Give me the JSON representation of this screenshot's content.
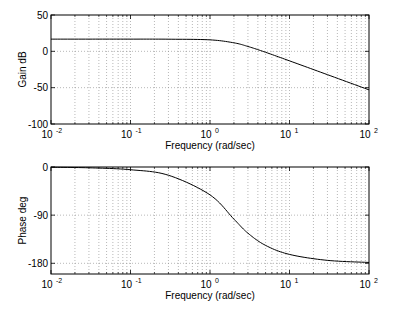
{
  "figure": {
    "width": 399,
    "height": 314,
    "background": "#ffffff",
    "line_color": "#000000",
    "grid_color": "#888888"
  },
  "chart_data": [
    {
      "type": "line",
      "title": "",
      "xlabel": "Frequency (rad/sec)",
      "ylabel": "Gain dB",
      "xscale": "log",
      "xlim": [
        0.01,
        100
      ],
      "ylim": [
        -100,
        50
      ],
      "xticks": [
        0.01,
        0.1,
        1,
        10,
        100
      ],
      "xtick_labels": [
        {
          "base": "10",
          "exp": "-2"
        },
        {
          "base": "10",
          "exp": "-1"
        },
        {
          "base": "10",
          "exp": "0"
        },
        {
          "base": "10",
          "exp": "1"
        },
        {
          "base": "10",
          "exp": "2"
        }
      ],
      "yticks": [
        50,
        0,
        -50,
        -100
      ],
      "ytick_labels": [
        "50",
        "0",
        "-50",
        "-100"
      ],
      "grid": true,
      "legend": null,
      "series": [
        {
          "name": "gain",
          "x": [
            0.01,
            0.03,
            0.1,
            0.3,
            1,
            2,
            3,
            5,
            10,
            30,
            100
          ],
          "y": [
            16.8,
            16.8,
            16.8,
            16.7,
            15.8,
            11.7,
            6.7,
            -1.3,
            -13.1,
            -32.1,
            -53.0
          ]
        }
      ]
    },
    {
      "type": "line",
      "title": "",
      "xlabel": "Frequency (rad/sec)",
      "ylabel": "Phase deg",
      "xscale": "log",
      "xlim": [
        0.01,
        100
      ],
      "ylim": [
        -200,
        0
      ],
      "xticks": [
        0.01,
        0.1,
        1,
        10,
        100
      ],
      "xtick_labels": [
        {
          "base": "10",
          "exp": "-2"
        },
        {
          "base": "10",
          "exp": "-1"
        },
        {
          "base": "10",
          "exp": "0"
        },
        {
          "base": "10",
          "exp": "1"
        },
        {
          "base": "10",
          "exp": "2"
        }
      ],
      "yticks": [
        0,
        -90,
        -180
      ],
      "ytick_labels": [
        "0",
        "-90",
        "-180"
      ],
      "grid": true,
      "legend": null,
      "series": [
        {
          "name": "phase",
          "x": [
            0.01,
            0.03,
            0.1,
            0.3,
            1,
            2,
            3,
            5,
            10,
            30,
            100
          ],
          "y": [
            -0.5,
            -1.5,
            -5.1,
            -15.4,
            -52.1,
            -97.5,
            -123.7,
            -146.5,
            -163.4,
            -174.5,
            -178.4
          ]
        }
      ]
    }
  ],
  "axes_layout": [
    {
      "left": 51,
      "top": 15,
      "right": 369,
      "bottom": 124
    },
    {
      "left": 51,
      "top": 167,
      "right": 369,
      "bottom": 274
    }
  ]
}
